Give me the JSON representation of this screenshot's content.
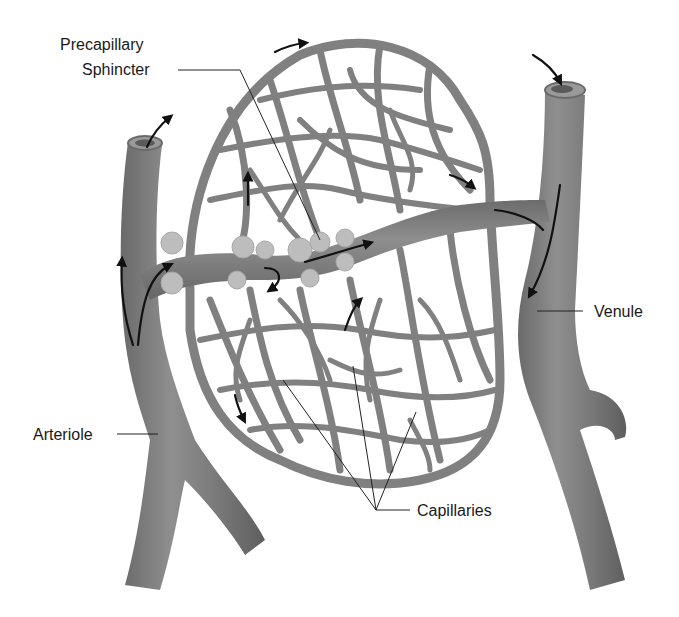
{
  "figure": {
    "colors": {
      "background": "#ffffff",
      "vessel": "#7a7a7a",
      "vessel_highlight": "#9a9a9a",
      "capillary": "#808080",
      "sphincter": "#bdbdbd",
      "text": "#1a1a1a",
      "arrow": "#111111"
    },
    "labels": {
      "precapillary_line1": "Precapillary",
      "precapillary_line2": "Sphincter",
      "venule": "Venule",
      "arteriole": "Arteriole",
      "capillaries": "Capillaries"
    },
    "structures": [
      {
        "name": "arteriole",
        "side": "left",
        "flow": "upward into metarteriole and capillaries"
      },
      {
        "name": "venule",
        "side": "right",
        "flow": "downward, collecting from capillaries"
      },
      {
        "name": "metarteriole / thoroughfare channel",
        "connects": "arteriole to venule"
      },
      {
        "name": "precapillary sphincters",
        "count_visible": 10,
        "location": "capillary origins along the thoroughfare channel"
      },
      {
        "name": "capillary network",
        "shape": "oval mesh"
      }
    ],
    "icons": [
      "flow-arrow-icon"
    ]
  }
}
